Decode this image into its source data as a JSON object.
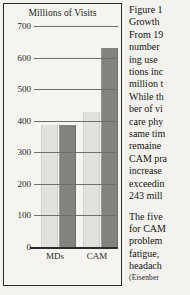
{
  "figure": {
    "label_line": "Figure 1",
    "heading": "Growth",
    "body_lines": [
      "From 19",
      "number ",
      "ing use ",
      "tions inc",
      "million t",
      "While th",
      "ber of vi",
      "care phy",
      "same tim",
      "remaine",
      "CAM pra",
      "increase",
      "exceedin",
      "243 mill"
    ],
    "body_lines_2": [
      "The five",
      "for CAM",
      "problem",
      "fatigue, ",
      "headach"
    ],
    "citation": "(Eisenber"
  },
  "chart_data": {
    "type": "bar",
    "title": "Millions of Visits",
    "xlabel": "",
    "ylabel": "Millions of Visits",
    "categories": [
      "MDs",
      "CAM"
    ],
    "series": [
      {
        "name": "light",
        "color": "#e2e1de",
        "values": [
          388,
          427
        ]
      },
      {
        "name": "dark",
        "color": "#83827f",
        "values": [
          388,
          629
        ]
      }
    ],
    "ylim": [
      0,
      700
    ],
    "yticks": [
      0,
      100,
      200,
      300,
      400,
      500,
      600,
      700
    ],
    "ytick_labels": [
      "0",
      "100",
      "200",
      "300",
      "400",
      "500",
      "600",
      "700"
    ],
    "grid": true,
    "legend": "none"
  }
}
